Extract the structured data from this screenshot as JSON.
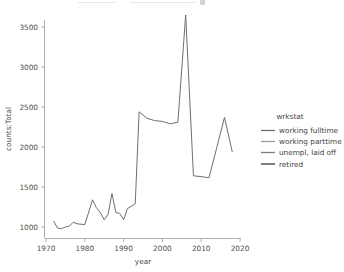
{
  "chart_data": {
    "type": "line",
    "title": "",
    "xlabel": "year",
    "ylabel": "counts:Total",
    "xlim": [
      1968,
      2022
    ],
    "ylim": [
      880,
      3720
    ],
    "grid": false,
    "xticks": [
      1970,
      1980,
      1990,
      2000,
      2010,
      2020
    ],
    "xticklabels": [
      "1970",
      "1980",
      "1990",
      "2000",
      "2010",
      "2020"
    ],
    "yticks": [
      1000,
      1500,
      2000,
      2500,
      3000,
      3500
    ],
    "yticklabels": [
      "1000",
      "1500",
      "2000",
      "2500",
      "3000",
      "3500"
    ],
    "line_color": "#6f6f6f",
    "series": [
      {
        "name": "working fulltime",
        "x": [
          1972,
          1973,
          1974,
          1975,
          1976,
          1977,
          1978,
          1980,
          1982,
          1983,
          1984,
          1985,
          1986,
          1987,
          1988,
          1989,
          1990,
          1991,
          1993,
          1994,
          1996,
          1998,
          2000,
          2002,
          2004,
          2006,
          2008,
          2010,
          2012,
          2014,
          2016,
          2018
        ],
        "y": [
          1070,
          985,
          980,
          1000,
          1010,
          1060,
          1040,
          1030,
          1340,
          1240,
          1180,
          1090,
          1160,
          1420,
          1180,
          1170,
          1090,
          1230,
          1290,
          2440,
          2360,
          2330,
          2320,
          2290,
          2310,
          3650,
          1640,
          1630,
          1615,
          1990,
          2370,
          1940
        ]
      }
    ],
    "legend": {
      "position": "right",
      "title": "wrkstat",
      "entries": [
        {
          "label": "working fulltime",
          "color": "#6f6f6f"
        },
        {
          "label": "working parttime",
          "color": "#9a9a9a"
        },
        {
          "label": "unempl, laid off",
          "color": "#7d7d7d"
        },
        {
          "label": "retired",
          "color": "#5f5f5f"
        }
      ]
    }
  },
  "axes": {
    "x_label": "year",
    "y_label": "counts:Total"
  }
}
